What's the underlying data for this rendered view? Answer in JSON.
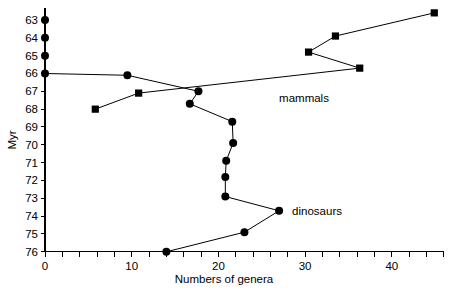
{
  "chart_data": {
    "type": "line",
    "title": "",
    "xlabel": "Numbers of genera",
    "ylabel": "Myr",
    "xlim": [
      0,
      46
    ],
    "ylim": [
      76,
      62.3
    ],
    "y_inverted": true,
    "grid": false,
    "legend_position": "inline-annotation",
    "x_ticks_labeled": [
      0,
      10,
      20,
      30,
      40
    ],
    "x_tick_labels": [
      "0",
      "10",
      "20",
      "30",
      "40"
    ],
    "x_minor_tick_step": 2,
    "y_ticks": [
      63,
      64,
      65,
      66,
      67,
      68,
      69,
      70,
      71,
      72,
      73,
      74,
      75,
      76
    ],
    "y_tick_labels": [
      "63",
      "64",
      "65",
      "66",
      "67",
      "68",
      "69",
      "70",
      "71",
      "72",
      "73",
      "74",
      "75",
      "76"
    ],
    "series": [
      {
        "name": "dinosaurs",
        "marker": "circle",
        "label": "dinosaurs",
        "label_x": 28.5,
        "label_y": 73.7,
        "points": [
          {
            "x": 0,
            "y": 63
          },
          {
            "x": 0,
            "y": 64
          },
          {
            "x": 0,
            "y": 65
          },
          {
            "x": 0,
            "y": 66
          },
          {
            "x": 9.5,
            "y": 66.1
          },
          {
            "x": 17.7,
            "y": 67.0
          },
          {
            "x": 16.7,
            "y": 67.7
          },
          {
            "x": 21.6,
            "y": 68.7
          },
          {
            "x": 21.7,
            "y": 69.9
          },
          {
            "x": 20.9,
            "y": 70.9
          },
          {
            "x": 20.8,
            "y": 71.8
          },
          {
            "x": 20.8,
            "y": 72.9
          },
          {
            "x": 27.0,
            "y": 73.7
          },
          {
            "x": 23.0,
            "y": 74.9
          },
          {
            "x": 14.0,
            "y": 76.0
          }
        ]
      },
      {
        "name": "mammals",
        "marker": "square",
        "label": "mammals",
        "label_x": 27.0,
        "label_y": 67.4,
        "points": [
          {
            "x": 5.8,
            "y": 68.0
          },
          {
            "x": 10.8,
            "y": 67.1
          },
          {
            "x": 36.3,
            "y": 65.7
          },
          {
            "x": 30.4,
            "y": 64.8
          },
          {
            "x": 33.5,
            "y": 63.9
          },
          {
            "x": 44.9,
            "y": 62.6
          }
        ]
      }
    ]
  },
  "axes": {
    "y_axis_title": "Myr",
    "x_axis_title": "Numbers of genera"
  },
  "annotations": {
    "mammals_label": "mammals",
    "dinosaurs_label": "dinosaurs"
  }
}
